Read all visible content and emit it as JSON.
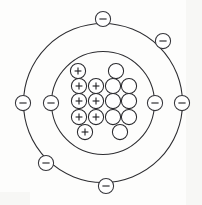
{
  "figure": {
    "element_name": "Oxygen",
    "background_color": "#fdfdfc",
    "line_color": "#2d2d31",
    "width": 202,
    "height": 205,
    "center_x": 103,
    "center_y": 103
  },
  "nucleus": {
    "label": "nucleus",
    "proton_count": 8,
    "neutron_count": 8,
    "proton_symbol": "+",
    "neutron_symbol": "",
    "particle_radius": 7.6,
    "particles": [
      {
        "type": "proton",
        "symbol": "+",
        "cx": 78,
        "cy": 71
      },
      {
        "type": "neutron",
        "symbol": "",
        "cx": 116,
        "cy": 71
      },
      {
        "type": "proton",
        "symbol": "+",
        "cx": 79,
        "cy": 86
      },
      {
        "type": "proton",
        "symbol": "+",
        "cx": 96,
        "cy": 86
      },
      {
        "type": "neutron",
        "symbol": "",
        "cx": 113,
        "cy": 86
      },
      {
        "type": "neutron",
        "symbol": "",
        "cx": 129,
        "cy": 86
      },
      {
        "type": "proton",
        "symbol": "+",
        "cx": 79,
        "cy": 101
      },
      {
        "type": "proton",
        "symbol": "+",
        "cx": 96,
        "cy": 101
      },
      {
        "type": "neutron",
        "symbol": "",
        "cx": 113,
        "cy": 101
      },
      {
        "type": "neutron",
        "symbol": "",
        "cx": 129,
        "cy": 101
      },
      {
        "type": "proton",
        "symbol": "+",
        "cx": 79,
        "cy": 117
      },
      {
        "type": "proton",
        "symbol": "+",
        "cx": 96,
        "cy": 117
      },
      {
        "type": "neutron",
        "symbol": "",
        "cx": 113,
        "cy": 117
      },
      {
        "type": "neutron",
        "symbol": "",
        "cx": 129,
        "cy": 117
      },
      {
        "type": "proton",
        "symbol": "+",
        "cx": 85,
        "cy": 132
      },
      {
        "type": "neutron",
        "symbol": "",
        "cx": 120,
        "cy": 132
      }
    ]
  },
  "shells": [
    {
      "label": "inner shell",
      "index": 1,
      "radius": 51.5,
      "electron_count": 2
    },
    {
      "label": "outer shell",
      "index": 2,
      "radius": 79.5,
      "electron_count": 6
    }
  ],
  "electrons": {
    "symbol": "–",
    "radius": 7.6,
    "items": [
      {
        "shell": 1,
        "position_label": "inner-left",
        "cx": 51,
        "cy": 103
      },
      {
        "shell": 1,
        "position_label": "inner-right",
        "cx": 155,
        "cy": 103
      },
      {
        "shell": 2,
        "position_label": "outer-top",
        "cx": 103,
        "cy": 19
      },
      {
        "shell": 2,
        "position_label": "outer-upper-right",
        "cx": 163,
        "cy": 41
      },
      {
        "shell": 2,
        "position_label": "outer-right",
        "cx": 182,
        "cy": 103
      },
      {
        "shell": 2,
        "position_label": "outer-bottom",
        "cx": 106,
        "cy": 186
      },
      {
        "shell": 2,
        "position_label": "outer-lower-left",
        "cx": 46,
        "cy": 163
      },
      {
        "shell": 2,
        "position_label": "outer-left",
        "cx": 23,
        "cy": 103
      }
    ]
  }
}
